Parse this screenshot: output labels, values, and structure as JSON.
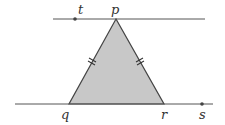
{
  "diagram": {
    "type": "geometry",
    "colors": {
      "line": "#555555",
      "fill": "#c8c8c8",
      "triangle_stroke": "#444444",
      "point": "#444444",
      "label": "#333333"
    },
    "lines": [
      {
        "id": "top-line",
        "x1": 53,
        "y1": 19,
        "x2": 205,
        "y2": 19
      },
      {
        "id": "bottom-line",
        "x1": 15,
        "y1": 104,
        "x2": 213,
        "y2": 104
      }
    ],
    "triangle": {
      "vertices": {
        "p": [
          116,
          19
        ],
        "q": [
          69,
          104
        ],
        "r": [
          164,
          104
        ]
      },
      "congruent_sides": [
        "pq",
        "pr"
      ],
      "tick_marks": 2
    },
    "points": [
      {
        "name": "t",
        "x": 75,
        "y": 19,
        "dot": true
      },
      {
        "name": "s",
        "x": 202,
        "y": 104,
        "dot": true
      }
    ],
    "labels": {
      "t": {
        "text": "t",
        "x": 78,
        "y": 3
      },
      "p": {
        "text": "p",
        "x": 111,
        "y": 3
      },
      "q": {
        "text": "q",
        "x": 61,
        "y": 108
      },
      "r": {
        "text": "r",
        "x": 161,
        "y": 108
      },
      "s": {
        "text": "s",
        "x": 199,
        "y": 108
      }
    }
  }
}
